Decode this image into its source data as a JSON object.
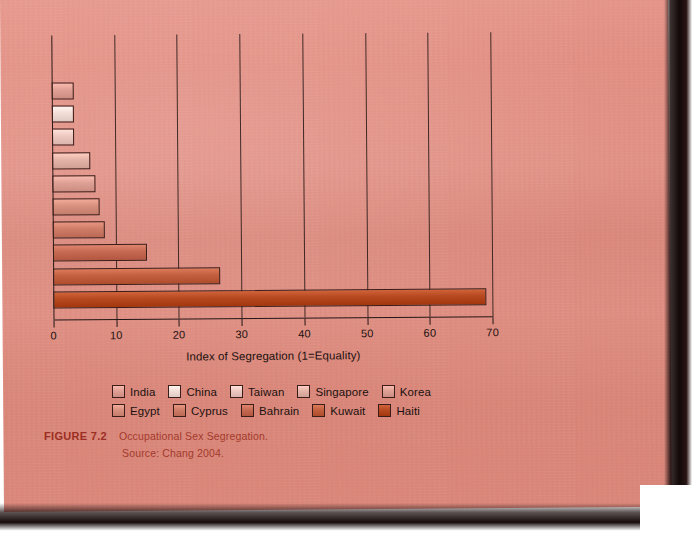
{
  "figure": {
    "number": "FIGURE 7.2",
    "title": "Occupational Sex Segregation.",
    "source": "Source: Chang 2004."
  },
  "chart_data": {
    "type": "bar",
    "orientation": "horizontal",
    "title": "Occupational Sex Segregation",
    "xlabel": "Index of Segregation (1=Equality)",
    "ylabel": "",
    "xlim": [
      0,
      70
    ],
    "xticks": [
      0,
      10,
      20,
      30,
      40,
      50,
      60,
      70
    ],
    "xticklabels": [
      "0",
      "10",
      "20",
      "30",
      "40",
      "50",
      "60",
      "70"
    ],
    "grid": "vertical",
    "legend_position": "bottom",
    "categories": [
      "India",
      "China",
      "Taiwan",
      "Singapore",
      "Korea",
      "Egypt",
      "Cyprus",
      "Bahrain",
      "Kuwait",
      "Haiti"
    ],
    "values": [
      3.5,
      3.5,
      3.5,
      6,
      6.8,
      7.5,
      8.3,
      15,
      26.7,
      69
    ],
    "colors": [
      "#e0a095",
      "#f3ddd7",
      "#edc9c1",
      "#e5b4a9",
      "#dfa195",
      "#d9917f",
      "#cf7d69",
      "#c76a54",
      "#c2603f",
      "#b74a21"
    ],
    "series": [
      {
        "name": "Index of Segregation",
        "values": [
          3.5,
          3.5,
          3.5,
          6,
          6.8,
          7.5,
          8.3,
          15,
          26.7,
          69
        ]
      }
    ]
  },
  "legend": {
    "row1": [
      {
        "label": "India",
        "color": "#e0a095"
      },
      {
        "label": "China",
        "color": "#f3ddd7"
      },
      {
        "label": "Taiwan",
        "color": "#edc9c1"
      },
      {
        "label": "Singapore",
        "color": "#e5b4a9"
      },
      {
        "label": "Korea",
        "color": "#dfa195"
      }
    ],
    "row2": [
      {
        "label": "Egypt",
        "color": "#d9917f"
      },
      {
        "label": "Cyprus",
        "color": "#cf7d69"
      },
      {
        "label": "Bahrain",
        "color": "#c76a54"
      },
      {
        "label": "Kuwait",
        "color": "#c2603f"
      },
      {
        "label": "Haiti",
        "color": "#b74a21"
      }
    ]
  },
  "colors": {
    "paper": "#e08d81",
    "ink": "#231616",
    "caption_red": "#9c2e22"
  }
}
